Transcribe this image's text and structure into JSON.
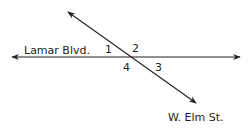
{
  "diagram": {
    "type": "intersecting-lines",
    "line_color": "#231f20",
    "intersection": {
      "x": 133,
      "y": 57
    },
    "lines": [
      {
        "name": "Lamar Blvd.",
        "from": {
          "x": 12,
          "y": 57
        },
        "to": {
          "x": 240,
          "y": 57
        },
        "arrows": "both"
      },
      {
        "name": "W. Elm St.",
        "from": {
          "x": 68,
          "y": 12
        },
        "to": {
          "x": 196,
          "y": 103
        },
        "arrows": "both"
      }
    ],
    "labels": {
      "street_1": "Lamar Blvd.",
      "street_2": "W. Elm St."
    },
    "angles": [
      {
        "id": "1",
        "label": "1",
        "x": 105,
        "y": 53
      },
      {
        "id": "2",
        "label": "2",
        "x": 132,
        "y": 52
      },
      {
        "id": "3",
        "label": "3",
        "x": 155,
        "y": 71
      },
      {
        "id": "4",
        "label": "4",
        "x": 123,
        "y": 71
      }
    ]
  }
}
